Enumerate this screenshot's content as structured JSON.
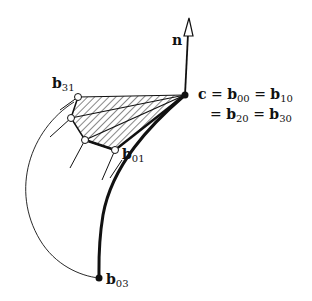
{
  "diagram": {
    "labels": {
      "normal": "n",
      "b31": "b",
      "b31_sub": "31",
      "b01": "b",
      "b01_sub": "01",
      "b03": "b",
      "b03_sub": "03",
      "eq_line1_c": "c",
      "eq_line1_eq1": " = ",
      "eq_line1_b": "b",
      "eq_line1_sub1": "00",
      "eq_line1_eq2": " = ",
      "eq_line1_b2": "b",
      "eq_line1_sub2": "10",
      "eq_line2_eq1": "= ",
      "eq_line2_b": "b",
      "eq_line2_sub1": "20",
      "eq_line2_eq2": " = ",
      "eq_line2_b2": "b",
      "eq_line2_sub2": "30"
    },
    "colors": {
      "stroke": "#111111",
      "background": "#ffffff"
    }
  }
}
